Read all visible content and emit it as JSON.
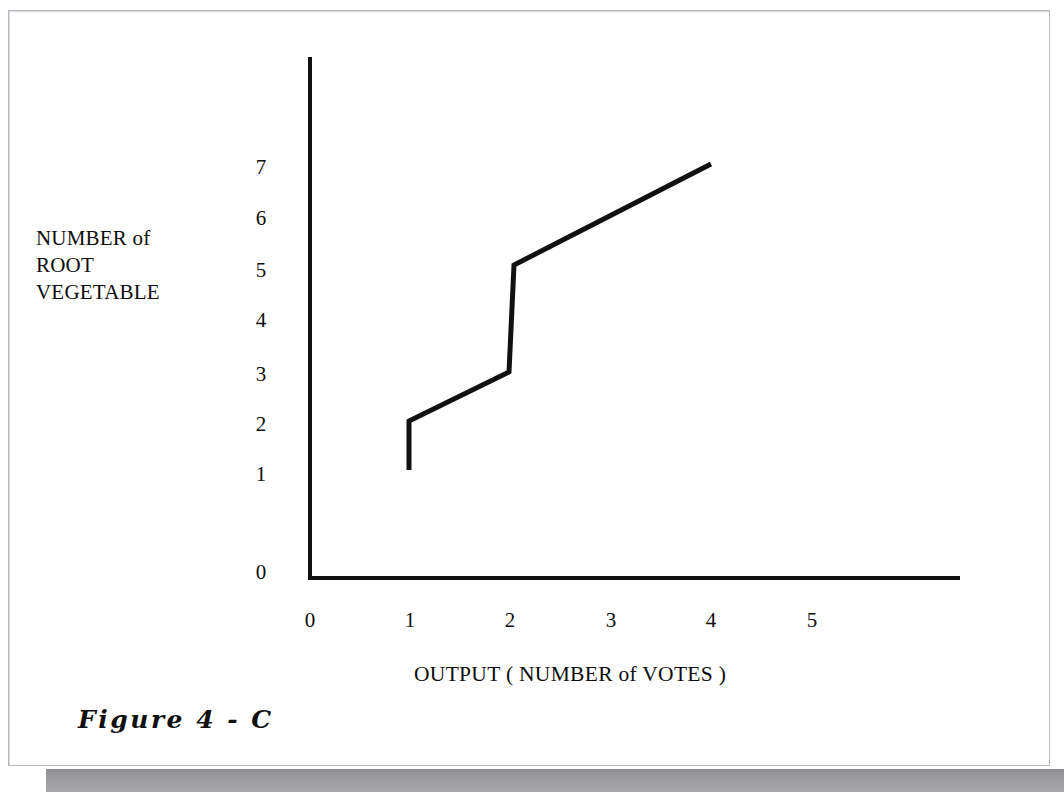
{
  "figure": {
    "caption": "Figure  4 - C",
    "background_color": "#ffffff",
    "ink_color": "#111111",
    "frame_color": "#b9b9bd",
    "scan_strip_color": "#9a9a9f"
  },
  "chart_data": {
    "type": "line",
    "title": "",
    "subtitle": "",
    "xlabel": "OUTPUT ( NUMBER of  VOTES )",
    "ylabel": "NUMBER of\nROOT\nVEGETABLE",
    "ylabel_lines": [
      "NUMBER of",
      "ROOT",
      "VEGETABLE"
    ],
    "x_ticks": [
      "0",
      "1",
      "2",
      "3",
      "4",
      "5"
    ],
    "x_tick_values": [
      0,
      1,
      2,
      3,
      4,
      5
    ],
    "y_ticks": [
      "0",
      "1",
      "2",
      "3",
      "4",
      "5",
      "6",
      "7"
    ],
    "y_tick_values": [
      0,
      1,
      2,
      3,
      4,
      5,
      6,
      7
    ],
    "xlim": [
      0,
      5.5
    ],
    "ylim": [
      0,
      7.8
    ],
    "grid": false,
    "legend": null,
    "annotations": [],
    "series": [
      {
        "name": "root vegetable step curve",
        "style": "step-with-sloped-segments",
        "points": [
          {
            "x": 1.0,
            "y": 1.0
          },
          {
            "x": 1.0,
            "y": 2.0
          },
          {
            "x": 2.05,
            "y": 3.0
          },
          {
            "x": 2.1,
            "y": 5.0
          },
          {
            "x": 4.0,
            "y": 7.0
          }
        ]
      }
    ]
  },
  "geometry": {
    "origin_px": {
      "x": 310,
      "y": 578
    },
    "y_axis_top_px": 57,
    "x_axis_right_px": 960,
    "x_tick_px": [
      310,
      410,
      510,
      611,
      711,
      812
    ],
    "y_tick_px": [
      570,
      472,
      422,
      372,
      318,
      268,
      216,
      165
    ],
    "curve_px": [
      {
        "x": 409,
        "y": 470
      },
      {
        "x": 409,
        "y": 421
      },
      {
        "x": 509,
        "y": 372
      },
      {
        "x": 514,
        "y": 265
      },
      {
        "x": 711,
        "y": 164
      }
    ]
  }
}
